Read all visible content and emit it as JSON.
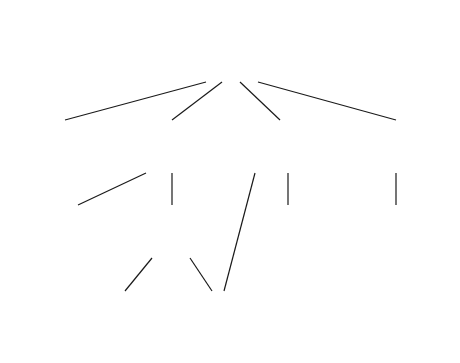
{
  "diagram": {
    "type": "structure-chart",
    "background_color": "#ffffff",
    "line_color": "#1a1a1a",
    "text_color": "#111111",
    "nodes": [
      {
        "id": "update-customer-file",
        "label": "Update\ncustomer\nfile",
        "level": 0,
        "x": 186,
        "y": 24,
        "w": 89,
        "h": 58
      },
      {
        "id": "initialize-control-totals",
        "label": "Initialize\ncontrol\ntotals &\nopen file",
        "level": 1,
        "x": 23,
        "y": 120,
        "w": 84,
        "h": 53
      },
      {
        "id": "create-new-customer-records",
        "label": "Create new\ncustomer\nrecords",
        "level": 1,
        "x": 133,
        "y": 120,
        "w": 79,
        "h": 53
      },
      {
        "id": "update-existing-customer-records",
        "label": "Update\nexisting\ncustomer\nrecords",
        "level": 1,
        "x": 248,
        "y": 120,
        "w": 82,
        "h": 53
      },
      {
        "id": "close-file-print-control-totals",
        "label": "Close file\n& print\ncontrol totals",
        "level": 1,
        "x": 355,
        "y": 120,
        "w": 85,
        "h": 53
      },
      {
        "id": "create-null-sale-records",
        "label": "Create\nnull sale\nrecords",
        "level": 2,
        "x": 38,
        "y": 205,
        "w": 80,
        "h": 53
      },
      {
        "id": "create-basic-customer-records",
        "label": "Create\nbasic\ncustomer\nrecords",
        "level": 2,
        "x": 133,
        "y": 205,
        "w": 79,
        "h": 53
      },
      {
        "id": "update-sale-records-or-customer-record",
        "label": "Update sale\nrecords or\ncustomer\nrecord",
        "level": 2,
        "x": 248,
        "y": 205,
        "w": 82,
        "h": 53
      },
      {
        "id": "print-control-totals",
        "label": "Print\ncontrol\ntotals",
        "level": 2,
        "x": 355,
        "y": 205,
        "w": 80,
        "h": 53
      },
      {
        "id": "create-status-codes",
        "label": "Create\nstatus codes",
        "level": 3,
        "x": 85,
        "y": 291,
        "w": 80,
        "h": 54
      },
      {
        "id": "edit-customer-number-name-address",
        "label": "Edit customer\nnumber, name,\n& address",
        "level": 3,
        "x": 185,
        "y": 291,
        "w": 80,
        "h": 54
      }
    ],
    "edges": [
      {
        "id": "edge-root-initialize",
        "from": "update-customer-file",
        "to": "initialize-control-totals",
        "x1": 206,
        "y1": 82,
        "x2": 65,
        "y2": 120
      },
      {
        "id": "edge-root-create-new",
        "from": "update-customer-file",
        "to": "create-new-customer-records",
        "x1": 222,
        "y1": 82,
        "x2": 172,
        "y2": 120
      },
      {
        "id": "edge-root-update-existing",
        "from": "update-customer-file",
        "to": "update-existing-customer-records",
        "x1": 240,
        "y1": 82,
        "x2": 280,
        "y2": 120
      },
      {
        "id": "edge-root-close-file",
        "from": "update-customer-file",
        "to": "close-file-print-control-totals",
        "x1": 258,
        "y1": 82,
        "x2": 396,
        "y2": 120
      },
      {
        "id": "edge-create-new-null-sale",
        "from": "create-new-customer-records",
        "to": "create-null-sale-records",
        "x1": 146,
        "y1": 173,
        "x2": 78,
        "y2": 205
      },
      {
        "id": "edge-create-new-basic",
        "from": "create-new-customer-records",
        "to": "create-basic-customer-records",
        "x1": 172,
        "y1": 173,
        "x2": 172,
        "y2": 205
      },
      {
        "id": "edge-update-existing-edit-customer",
        "from": "update-existing-customer-records",
        "to": "edit-customer-number-name-address",
        "x1": 255,
        "y1": 173,
        "x2": 224,
        "y2": 291
      },
      {
        "id": "edge-update-existing-update-sale",
        "from": "update-existing-customer-records",
        "to": "update-sale-records-or-customer-record",
        "x1": 288,
        "y1": 173,
        "x2": 288,
        "y2": 205
      },
      {
        "id": "edge-close-file-print-totals",
        "from": "close-file-print-control-totals",
        "to": "print-control-totals",
        "x1": 396,
        "y1": 173,
        "x2": 396,
        "y2": 205
      },
      {
        "id": "edge-basic-status-codes",
        "from": "create-basic-customer-records",
        "to": "create-status-codes",
        "x1": 152,
        "y1": 258,
        "x2": 125,
        "y2": 291
      },
      {
        "id": "edge-basic-edit-customer",
        "from": "create-basic-customer-records",
        "to": "edit-customer-number-name-address",
        "x1": 190,
        "y1": 258,
        "x2": 212,
        "y2": 291
      }
    ],
    "artifacts": [
      {
        "id": "speck-mark",
        "x": 48,
        "y": 70
      }
    ]
  }
}
